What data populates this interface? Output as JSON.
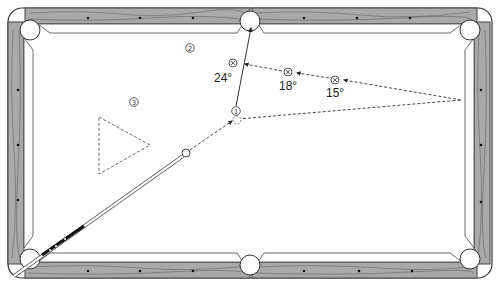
{
  "diagram": {
    "colors": {
      "rail_wood": "#a9a9a9",
      "rail_outline": "#444444",
      "cloth": "#ffffff",
      "line": "#333333",
      "grain": "#555555"
    },
    "ball_markers": [
      {
        "id": "1",
        "label": "①",
        "x": 236,
        "y": 111
      },
      {
        "id": "2",
        "label": "②",
        "x": 190,
        "y": 48
      },
      {
        "id": "3",
        "label": "③",
        "x": 134,
        "y": 102
      }
    ],
    "aim_points": [
      {
        "label": "24°",
        "x_mark": 233,
        "y_mark": 63,
        "tx": 223,
        "ty": 80
      },
      {
        "label": "18°",
        "x_mark": 288,
        "y_mark": 72,
        "tx": 289,
        "ty": 89
      },
      {
        "label": "15°",
        "x_mark": 335,
        "y_mark": 80,
        "tx": 336,
        "ty": 97
      }
    ],
    "cue_ball": {
      "x": 186,
      "y": 153
    },
    "object_ball_target": {
      "x": 236,
      "y": 120
    },
    "pocket_target": {
      "x": 251,
      "y": 24
    },
    "rail_point": {
      "x": 461,
      "y": 100
    },
    "rack_triangle": [
      [
        99,
        117
      ],
      [
        150,
        145
      ],
      [
        99,
        174
      ]
    ],
    "diamonds_top": [
      88,
      140,
      193,
      303,
      357,
      409
    ],
    "diamonds_bottom": [
      88,
      140,
      193,
      303,
      357,
      409
    ],
    "diamonds_left": [
      90,
      143,
      200
    ],
    "diamonds_right": [
      90,
      143,
      200
    ]
  }
}
